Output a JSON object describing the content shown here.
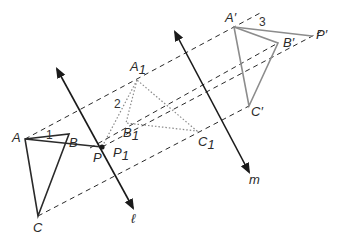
{
  "diagram": {
    "type": "geometry-reflection-composition",
    "colors": {
      "original": "#2a2a2a",
      "first_image": "#8a8a8a",
      "final_image": "#8c8c8c",
      "dashed": "#2a2a2a",
      "lines": "#1a1a1a"
    },
    "lines": [
      {
        "label": "ℓ",
        "from": [
          57,
          69
        ],
        "to": [
          133,
          208
        ],
        "label_pos": [
          133,
          222
        ]
      },
      {
        "label": "m",
        "from": [
          175,
          32
        ],
        "to": [
          249,
          172
        ],
        "label_pos": [
          249,
          183
        ]
      }
    ],
    "triangles": {
      "original": {
        "vertices": {
          "A": [
            25,
            139
          ],
          "B": [
            69,
            134
          ],
          "C": [
            38,
            216
          ]
        },
        "style": "solid-dark"
      },
      "first_image": {
        "vertices": {
          "A1": [
            137,
            80
          ],
          "B1": [
            126,
            123
          ],
          "C1": [
            197,
            131
          ]
        },
        "style": "dotted-gray"
      },
      "final_image": {
        "vertices": {
          "A'": [
            234,
            27
          ],
          "B'": [
            278,
            43
          ],
          "C'": [
            249,
            106
          ]
        },
        "style": "solid-gray"
      }
    },
    "points": {
      "P": [
        102,
        147
      ],
      "P1": [
        102,
        147
      ],
      "P'": [
        312,
        36
      ]
    },
    "segments": [
      {
        "from": "A",
        "to": "P",
        "style": "solid-dark"
      },
      {
        "from": "A1",
        "to": "P1",
        "style": "dotted-gray"
      },
      {
        "from": "A'",
        "to": "P'",
        "style": "solid-gray"
      }
    ],
    "labels": {
      "A": "A",
      "B": "B",
      "C": "C",
      "P": "P",
      "P1_main": "P",
      "P1_sub": "1",
      "A1_main": "A",
      "A1_sub": "1",
      "B1_main": "B",
      "B1_sub": "1",
      "C1_main": "C",
      "C1_sub": "1",
      "A_prime": "A′",
      "B_prime": "B′",
      "C_prime": "C′",
      "P_prime": "P′",
      "angle_1": "1",
      "angle_2": "2",
      "angle_3": "3",
      "line_l": "ℓ",
      "line_m": "m"
    }
  }
}
